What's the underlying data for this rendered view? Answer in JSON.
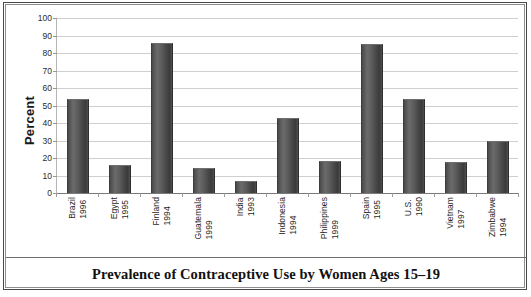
{
  "chart_data": {
    "type": "bar",
    "title": "Prevalence of Contraceptive Use by Women Ages 15–19",
    "xlabel": "",
    "ylabel": "Percent",
    "ylim": [
      0,
      100
    ],
    "ytick_interval": 10,
    "yticks": [
      100,
      90,
      80,
      70,
      60,
      50,
      40,
      30,
      20,
      10,
      0
    ],
    "grid": true,
    "legend": "none",
    "bar_color": "#4f4f4f",
    "categories": [
      "Brazil\n1996",
      "Egypt\n1995",
      "Finland\n1994",
      "Guatemala\n1999",
      "India\n1993",
      "Indonesia\n1994",
      "Philippines\n1999",
      "Spain\n1995",
      "U.S.\n1990",
      "Vietnam\n1997",
      "Zimbabwe\n1994"
    ],
    "values": [
      54,
      16,
      86,
      14.5,
      7,
      43,
      18.5,
      85,
      54,
      17.5,
      30
    ],
    "points": [
      {
        "country": "Brazil",
        "year": "1996",
        "value": 54
      },
      {
        "country": "Egypt",
        "year": "1995",
        "value": 16
      },
      {
        "country": "Finland",
        "year": "1994",
        "value": 86
      },
      {
        "country": "Guatemala",
        "year": "1999",
        "value": 14.5
      },
      {
        "country": "India",
        "year": "1993",
        "value": 7
      },
      {
        "country": "Indonesia",
        "year": "1994",
        "value": 43
      },
      {
        "country": "Philippines",
        "year": "1999",
        "value": 18.5
      },
      {
        "country": "Spain",
        "year": "1995",
        "value": 85
      },
      {
        "country": "U.S.",
        "year": "1990",
        "value": 54
      },
      {
        "country": "Vietnam",
        "year": "1997",
        "value": 17.5
      },
      {
        "country": "Zimbabwe",
        "year": "1994",
        "value": 30
      }
    ]
  },
  "axis": {
    "y_title": "Percent",
    "y_tick_labels": [
      "100",
      "90",
      "80",
      "70",
      "60",
      "50",
      "40",
      "30",
      "20",
      "10",
      "0"
    ]
  },
  "caption": {
    "text": "Prevalence of Contraceptive Use by Women Ages 15–19"
  },
  "source": {
    "text": ""
  }
}
